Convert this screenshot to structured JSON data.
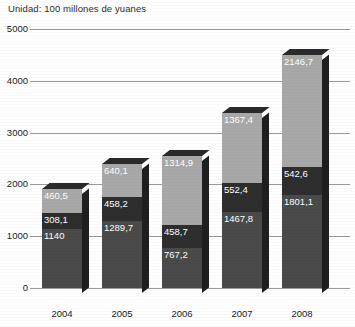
{
  "chart_data": {
    "type": "bar",
    "stacked": true,
    "title": "Unidad: 100 millones de yuanes",
    "xlabel": "",
    "ylabel": "",
    "ylim": [
      0,
      5000
    ],
    "yticks": [
      0,
      1000,
      2000,
      3000,
      4000,
      5000
    ],
    "ytick_labels": [
      "0",
      "1000",
      "2000",
      "3000",
      "4000",
      "5000"
    ],
    "grid": true,
    "legend": "none",
    "categories": [
      "2004",
      "2005",
      "2006",
      "2007",
      "2008"
    ],
    "series": [
      {
        "name": "segmento-inferior",
        "values": [
          1140,
          1289.7,
          767.2,
          1467.8,
          1801.1
        ],
        "labels": [
          "1140",
          "1289,7",
          "767,2",
          "1467,8",
          "1801,1"
        ],
        "color": "#4a4a4a"
      },
      {
        "name": "segmento-medio",
        "values": [
          308.1,
          458.2,
          458.7,
          552.4,
          542.6
        ],
        "labels": [
          "308,1",
          "458,2",
          "458,7",
          "552,4",
          "542,6"
        ],
        "color": "#2e2e2e"
      },
      {
        "name": "segmento-superior",
        "values": [
          460.5,
          640.1,
          1314.9,
          1367.4,
          2146.7
        ],
        "labels": [
          "460,5",
          "640,1",
          "1314,9",
          "1367,4",
          "2146,7"
        ],
        "color": "#a8a8a8"
      }
    ],
    "totals": [
      1908.6,
      2388.0,
      2540.8,
      3387.6,
      4490.4
    ]
  }
}
